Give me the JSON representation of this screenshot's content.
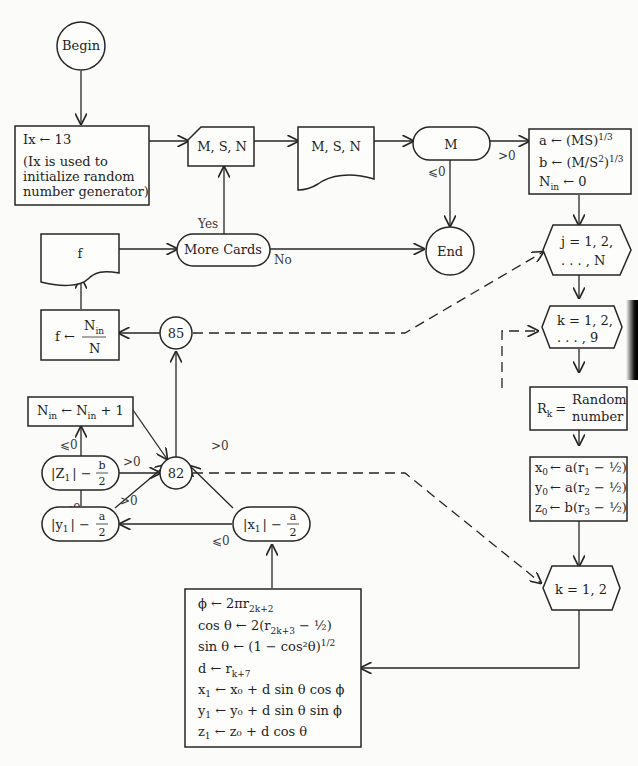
{
  "nodes": {
    "begin": {
      "label": "Begin",
      "type": "terminal-circle"
    },
    "init": {
      "line1": "Ix ← 13",
      "line2": "(Ix is used to",
      "line3": "initialize random",
      "line4": "number generator)"
    },
    "read_cards": {
      "label": "M, S, N",
      "type": "card-input"
    },
    "print_msn": {
      "label": "M, S, N",
      "type": "document-output"
    },
    "test_m": {
      "label": "M",
      "type": "decision-oval"
    },
    "end": {
      "label": "End",
      "type": "terminal-circle"
    },
    "compute_ab": {
      "line1_lhs": "a ← (MS)",
      "line1_sup": "1/3",
      "line2_lhs": "b ← (M/S",
      "line2_sq": "2",
      "line2_rhs": ")",
      "line2_sup": "1/3",
      "line3_var": "N",
      "line3_sub": "in",
      "line3_rhs": " ← 0"
    },
    "loop_j": {
      "line1": "j = 1, 2,",
      "line2": ". . . , N"
    },
    "loop_k9": {
      "line1": "k = 1, 2,",
      "line2": ". . . , 9"
    },
    "random": {
      "lhs": "R",
      "lhs_sub": "k",
      "eq": "=",
      "rhs1": "Random",
      "rhs2": "number"
    },
    "init_xyz": {
      "lines": [
        {
          "var": "x",
          "sub": "0",
          "rhs": "← a(r",
          "rsub": "1",
          "tail": " − ½)"
        },
        {
          "var": "y",
          "sub": "0",
          "rhs": "← a(r",
          "rsub": "2",
          "tail": " − ½)"
        },
        {
          "var": "z",
          "sub": "0",
          "rhs": "← b(r",
          "rsub": "3",
          "tail": " − ½)"
        }
      ]
    },
    "loop_k2": {
      "label": "k = 1, 2"
    },
    "step": {
      "lines": [
        {
          "text": "ϕ ← 2πr",
          "sub": "2k+2",
          "tail": ""
        },
        {
          "text": "cos θ ← 2(r",
          "sub": "2k+3",
          "tail": " − ½)"
        },
        {
          "text": "sin θ ← (1 − cos²θ)",
          "sup": "1/2",
          "tail": ""
        },
        {
          "text": "d ← r",
          "sub": "k+7",
          "tail": ""
        },
        {
          "text": "x",
          "sub": "1",
          "tail": " ← x₀ + d sin θ cos ϕ"
        },
        {
          "text": "y",
          "sub": "1",
          "tail": " ← y₀ + d sin θ sin ϕ"
        },
        {
          "text": "z",
          "sub": "1",
          "tail": " ← z₀ + d cos θ"
        }
      ]
    },
    "test_x": {
      "lhs": "|x",
      "sub": "1",
      "rhs": "| −",
      "num": "a",
      "den": "2"
    },
    "test_y": {
      "lhs": "|y",
      "sub": "1",
      "rhs": "| −",
      "num": "a",
      "den": "2"
    },
    "test_z": {
      "lhs": "|Z",
      "sub": "1",
      "rhs": "| −",
      "num": "b",
      "den": "2"
    },
    "count": {
      "var": "N",
      "sub": "in",
      "mid": " ← N",
      "sub2": "in",
      "tail": " + 1"
    },
    "conn82": {
      "label": "82"
    },
    "conn85": {
      "label": "85"
    },
    "compute_f": {
      "lhs": "f ←",
      "num": "N",
      "num_sub": "in",
      "den": "N"
    },
    "print_f": {
      "label": "f",
      "type": "document-output"
    },
    "more_cards": {
      "label": "More Cards",
      "type": "decision-oval"
    }
  },
  "edge_labels": {
    "m_pos": ">0",
    "m_nonpos": "⩽0",
    "more_yes": "Yes",
    "more_no": "No",
    "x_pos": ">0",
    "x_nonpos": "⩽0",
    "y_pos": ">0",
    "y_nonpos": "⩽0",
    "z_pos": ">0",
    "z_nonpos": "⩽0"
  }
}
